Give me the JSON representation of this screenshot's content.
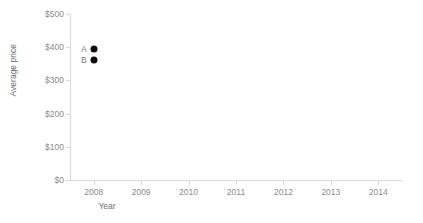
{
  "chart_data": {
    "type": "scatter",
    "title": "",
    "xlabel": "Year",
    "ylabel": "Average price",
    "xlim": [
      2007.5,
      2014.5
    ],
    "ylim": [
      0,
      500
    ],
    "grid": false,
    "legend_position": "inline-point-labels",
    "x_tick_labels": [
      "2008",
      "2009",
      "2010",
      "2011",
      "2012",
      "2013",
      "2014"
    ],
    "x_tick_values": [
      2008,
      2009,
      2010,
      2011,
      2012,
      2013,
      2014
    ],
    "y_tick_labels": [
      "$0",
      "$100",
      "$200",
      "$300",
      "$400",
      "$500"
    ],
    "y_tick_values": [
      0,
      100,
      200,
      300,
      400,
      500
    ],
    "points": [
      {
        "label": "A",
        "x": 2008,
        "y": 395
      },
      {
        "label": "B",
        "x": 2008,
        "y": 360
      }
    ],
    "marker_color": "#0d0d0d",
    "axis_color": "#d9d9d9",
    "text_color": "#8c8c8c"
  }
}
